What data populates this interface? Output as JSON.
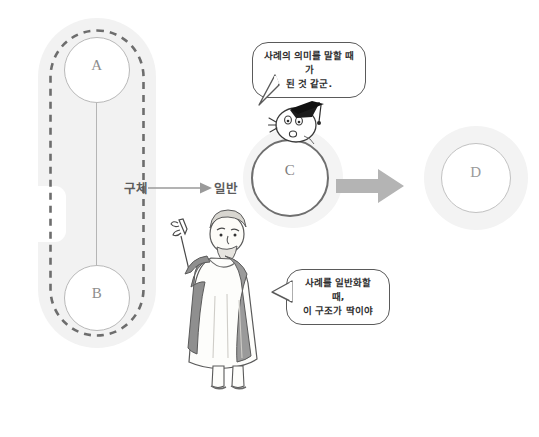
{
  "diagram": {
    "nodes": [
      {
        "id": "a",
        "label": "A"
      },
      {
        "id": "b",
        "label": "B"
      },
      {
        "id": "c",
        "label": "C"
      },
      {
        "id": "d",
        "label": "D"
      }
    ],
    "middle_arrow": {
      "from_label": "구체",
      "to_label": "일반"
    },
    "speech_bubbles": [
      {
        "id": "top",
        "speaker": "graduate-character",
        "text": "사례의 의미를 말할 때가\n된 것 같군."
      },
      {
        "id": "lower",
        "speaker": "sage-character",
        "text": "사례를 일반화할 때,\n이 구조가 딱이야"
      }
    ],
    "characters": [
      {
        "id": "graduate-character",
        "name": "cartoon figure with graduation cap"
      },
      {
        "id": "sage-character",
        "name": "bearded sage in robe pointing upward"
      }
    ],
    "colors": {
      "background": "#ffffff",
      "halo": "#f2f2f2",
      "node_stroke_light": "#b9b9b9",
      "node_stroke_dark": "#6f6f6f",
      "label_text": "#8d8d8d",
      "big_arrow": "#b4b4b4",
      "dashed_stroke": "#6d6d6d",
      "kr_label_text": "#5c5c5c",
      "bubble_stroke": "#5a5a5a"
    }
  }
}
